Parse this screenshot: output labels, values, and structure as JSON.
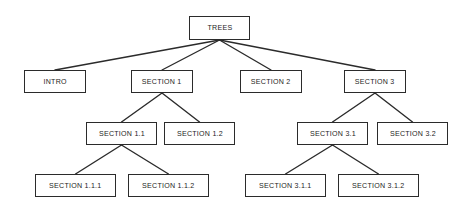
{
  "diagram": {
    "title": "TREES",
    "type": "tree-hierarchy",
    "background_color": "#ffffff",
    "line_color": "#2b2b2b",
    "text_color": "#1d1d1d",
    "box_border_color": "#2b2b2b",
    "box_fill_color": "#ffffff",
    "watermark_text": "",
    "nodes": [
      {
        "id": "trees",
        "label": "TREES",
        "level": 0,
        "x": 189,
        "y": 16,
        "w": 61,
        "h": 24
      },
      {
        "id": "intro",
        "label": "INTRO",
        "level": 1,
        "x": 24,
        "y": 70,
        "w": 62,
        "h": 23
      },
      {
        "id": "s1",
        "label": "SECTION 1",
        "level": 1,
        "x": 131,
        "y": 70,
        "w": 62,
        "h": 23
      },
      {
        "id": "s2",
        "label": "SECTION 2",
        "level": 1,
        "x": 240,
        "y": 70,
        "w": 62,
        "h": 23
      },
      {
        "id": "s3",
        "label": "SECTION 3",
        "level": 1,
        "x": 344,
        "y": 70,
        "w": 62,
        "h": 23
      },
      {
        "id": "s1_1",
        "label": "SECTION 1.1",
        "level": 2,
        "x": 86,
        "y": 122,
        "w": 71,
        "h": 23
      },
      {
        "id": "s1_2",
        "label": "SECTION 1.2",
        "level": 2,
        "x": 164,
        "y": 122,
        "w": 71,
        "h": 23
      },
      {
        "id": "s3_1",
        "label": "SECTION 3.1",
        "level": 2,
        "x": 297,
        "y": 122,
        "w": 71,
        "h": 23
      },
      {
        "id": "s3_2",
        "label": "SECTION 3.2",
        "level": 2,
        "x": 377,
        "y": 122,
        "w": 71,
        "h": 23
      },
      {
        "id": "s1_1_1",
        "label": "SECTION 1.1.1",
        "level": 3,
        "x": 35,
        "y": 174,
        "w": 81,
        "h": 23
      },
      {
        "id": "s1_1_2",
        "label": "SECTION 1.1.2",
        "level": 3,
        "x": 128,
        "y": 174,
        "w": 81,
        "h": 23
      },
      {
        "id": "s3_1_1",
        "label": "SECTION 3.1.1",
        "level": 3,
        "x": 245,
        "y": 174,
        "w": 81,
        "h": 23
      },
      {
        "id": "s3_1_2",
        "label": "SECTION 3.1.2",
        "level": 3,
        "x": 338,
        "y": 174,
        "w": 81,
        "h": 23
      }
    ],
    "edges": [
      {
        "from": "trees",
        "to": "intro",
        "x1": 219.5,
        "y1": 40,
        "x2": 55,
        "y2": 70
      },
      {
        "from": "trees",
        "to": "s1",
        "x1": 219.5,
        "y1": 40,
        "x2": 162,
        "y2": 70
      },
      {
        "from": "trees",
        "to": "s2",
        "x1": 219.5,
        "y1": 40,
        "x2": 271,
        "y2": 70
      },
      {
        "from": "trees",
        "to": "s3",
        "x1": 219.5,
        "y1": 40,
        "x2": 375,
        "y2": 70
      },
      {
        "from": "s1",
        "to": "s1_1",
        "x1": 162,
        "y1": 93,
        "x2": 121.5,
        "y2": 122
      },
      {
        "from": "s1",
        "to": "s1_2",
        "x1": 162,
        "y1": 93,
        "x2": 199.5,
        "y2": 122
      },
      {
        "from": "s3",
        "to": "s3_1",
        "x1": 375,
        "y1": 93,
        "x2": 332.5,
        "y2": 122
      },
      {
        "from": "s3",
        "to": "s3_2",
        "x1": 375,
        "y1": 93,
        "x2": 412.5,
        "y2": 122
      },
      {
        "from": "s1_1",
        "to": "s1_1_1",
        "x1": 121.5,
        "y1": 145,
        "x2": 75.5,
        "y2": 174
      },
      {
        "from": "s1_1",
        "to": "s1_1_2",
        "x1": 121.5,
        "y1": 145,
        "x2": 168.5,
        "y2": 174
      },
      {
        "from": "s3_1",
        "to": "s3_1_1",
        "x1": 332.5,
        "y1": 145,
        "x2": 285.5,
        "y2": 174
      },
      {
        "from": "s3_1",
        "to": "s3_1_2",
        "x1": 332.5,
        "y1": 145,
        "x2": 378.5,
        "y2": 174
      }
    ]
  }
}
